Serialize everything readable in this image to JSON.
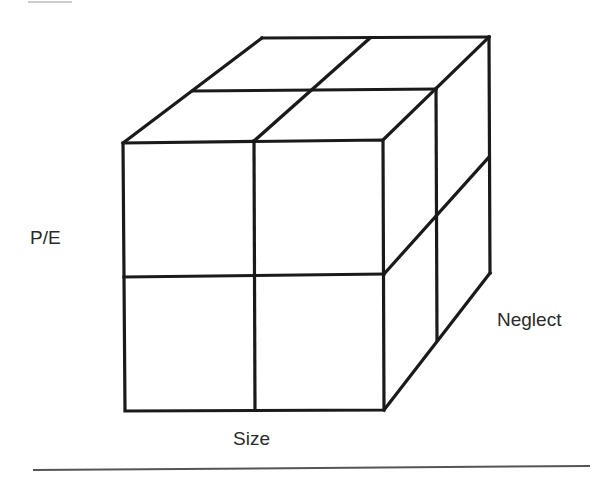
{
  "diagram": {
    "type": "cube-2x2x2",
    "axes": {
      "vertical": "P/E",
      "horizontal": "Size",
      "depth": "Neglect"
    },
    "colors": {
      "line": "#1a1a1a",
      "text": "#2a2a2a",
      "background": "#ffffff",
      "rule": "#555555"
    }
  }
}
